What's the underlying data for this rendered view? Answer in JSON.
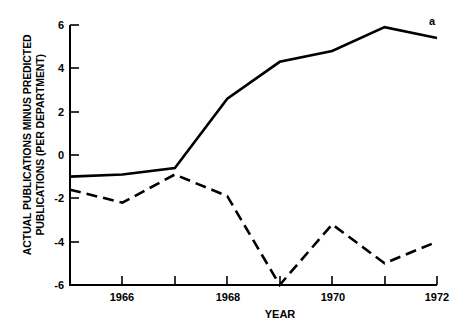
{
  "chart_data": {
    "type": "line",
    "title": "",
    "subtitle": "",
    "xlabel": "YEAR",
    "ylabel": "ACTUAL PUBLICATIONS MINUS PREDICTED PUBLICATIONS (PER DEPARTMENT)",
    "ylabel_lines": [
      "ACTUAL PUBLICATIONS MINUS PREDICTED",
      "PUBLICATIONS (PER DEPARTMENT)"
    ],
    "x": [
      1965,
      1966,
      1967,
      1968,
      1969,
      1970,
      1971,
      1972
    ],
    "xlim": [
      1965,
      1972
    ],
    "ylim": [
      -6,
      6
    ],
    "grid": false,
    "legend_position": "inline-annotation",
    "x_ticks_major": [
      1966,
      1968,
      1970,
      1972
    ],
    "x_ticks_minor": [
      1965,
      1967,
      1969,
      1971
    ],
    "x_tick_labels": [
      "1966",
      "1968",
      "1970",
      "1972"
    ],
    "y_ticks": [
      6,
      4,
      2,
      0,
      -2,
      -4,
      -6
    ],
    "y_tick_labels": [
      "6",
      "4",
      "2",
      "0",
      "-2",
      "-4",
      "-6"
    ],
    "annotations": [
      {
        "text": "a",
        "x": 1972,
        "y": 5.9
      }
    ],
    "series": [
      {
        "name": "a",
        "style": "solid",
        "color": "#000000",
        "values": [
          -1.0,
          -0.9,
          -0.6,
          2.6,
          4.3,
          4.8,
          5.9,
          5.4
        ]
      },
      {
        "name": "b",
        "style": "dashed",
        "color": "#000000",
        "values": [
          -1.6,
          -2.2,
          -0.9,
          -1.9,
          -6.0,
          -3.2,
          -5.0,
          -4.0
        ]
      }
    ]
  },
  "axes": {
    "y_label_line1": "ACTUAL PUBLICATIONS MINUS PREDICTED",
    "y_label_line2": "PUBLICATIONS (PER DEPARTMENT)",
    "x_label": "YEAR",
    "y_ticks": [
      "6",
      "4",
      "2",
      "0",
      "-2",
      "-4",
      "-6"
    ],
    "x_ticks": [
      "1966",
      "1968",
      "1970",
      "1972"
    ]
  },
  "annotation_a": "a",
  "colors": {
    "ink": "#000000",
    "background": "#ffffff"
  }
}
